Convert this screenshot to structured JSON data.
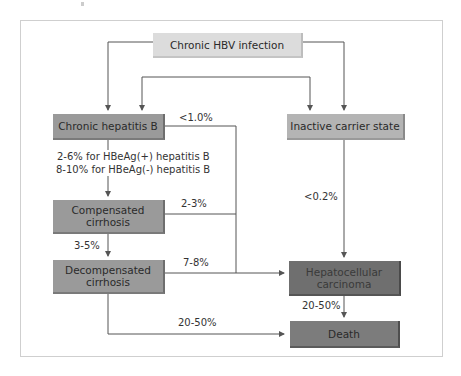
{
  "diagram": {
    "title": "",
    "nodes": {
      "chronic_hbv": "Chronic HBV infection",
      "chronic_hepatitis_b": "Chronic hepatitis B",
      "inactive_carrier": "Inactive carrier state",
      "compensated_cirrhosis": "Compensated cirrhosis",
      "decompensated_cirrhosis": "Decompensated cirrhosis",
      "hcc": "Hepatocellular carcinoma",
      "death": "Death"
    },
    "edge_labels": {
      "chb_to_hcc": "<1.0%",
      "chb_to_cc_line1": "2-6% for HBeAg(+) hepatitis B",
      "chb_to_cc_line2": "8-10% for HBeAg(-) hepatitis B",
      "cc_to_hcc": "2-3%",
      "cc_to_dc": "3-5%",
      "dc_to_hcc": "7-8%",
      "inactive_to_hcc": "<0.2%",
      "hcc_to_death": "20-50%",
      "dc_to_death": "20-50%"
    },
    "edges": [
      {
        "from": "chronic_hbv",
        "to": "chronic_hepatitis_b"
      },
      {
        "from": "chronic_hbv",
        "to": "inactive_carrier"
      },
      {
        "from": "chronic_hepatitis_b",
        "to": "inactive_carrier",
        "bidirectional": true
      },
      {
        "from": "chronic_hepatitis_b",
        "to": "compensated_cirrhosis"
      },
      {
        "from": "chronic_hepatitis_b",
        "to": "hcc"
      },
      {
        "from": "compensated_cirrhosis",
        "to": "decompensated_cirrhosis"
      },
      {
        "from": "compensated_cirrhosis",
        "to": "hcc"
      },
      {
        "from": "decompensated_cirrhosis",
        "to": "hcc"
      },
      {
        "from": "decompensated_cirrhosis",
        "to": "death"
      },
      {
        "from": "inactive_carrier",
        "to": "hcc"
      },
      {
        "from": "hcc",
        "to": "death"
      }
    ],
    "colors": {
      "line": "#555555",
      "frame": "#cfcfcf"
    }
  }
}
